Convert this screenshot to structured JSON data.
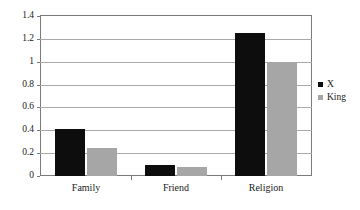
{
  "chart_data": {
    "type": "bar",
    "title": "",
    "subtitle": "",
    "xlabel": "",
    "ylabel": "",
    "categories": [
      "Family",
      "Friend",
      "Religion"
    ],
    "series": [
      {
        "name": "X",
        "color": "#0d0d0d",
        "values": [
          0.41,
          0.1,
          1.25
        ]
      },
      {
        "name": "King",
        "color": "#a6a6a6",
        "values": [
          0.245,
          0.075,
          1.0
        ]
      }
    ],
    "ylim": [
      0,
      1.4
    ],
    "ytick_labels": [
      "0",
      "0.2",
      "0.4",
      "0.6",
      "0.8",
      "1",
      "1.2",
      "1.4"
    ],
    "ytick_values": [
      0,
      0.2,
      0.4,
      0.6,
      0.8,
      1,
      1.2,
      1.4
    ],
    "grid": true,
    "grid_axis": "y",
    "legend_position": "right",
    "annotations": []
  },
  "style": {
    "plot_background": "#ffffff",
    "frame_color": "#7a7a7a",
    "grid_color": "#a9a9a9",
    "text_color": "#1a1a1a"
  }
}
